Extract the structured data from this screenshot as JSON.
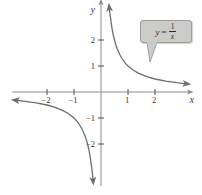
{
  "figure": {
    "background": "#ffffff",
    "axis_color": "#8d8d8d",
    "curve_color": "#6e6e6e",
    "tick_color": "#4d4d4d",
    "label_color": "#333333",
    "callout": {
      "fill": "#cbcbca",
      "border": "#9d9d9c",
      "lhs": "y",
      "equals": "=",
      "numerator": "1",
      "denominator": "x"
    }
  },
  "chart_data": {
    "type": "line",
    "title": "",
    "expression": "y = 1/x",
    "xlabel": "x",
    "ylabel": "y",
    "xlim": [
      -3.3,
      3.4
    ],
    "ylim": [
      -3.6,
      3.4
    ],
    "grid": false,
    "legend": "none",
    "x_ticks": [
      -2,
      -1,
      1,
      2
    ],
    "x_tick_labels": [
      "−2",
      "−1",
      "1",
      "2"
    ],
    "y_ticks": [
      -2,
      -1,
      1,
      2
    ],
    "y_tick_labels": [
      "−2",
      "−1",
      "1",
      "2"
    ],
    "series": [
      {
        "name": "positive-branch",
        "points": [
          [
            0.3,
            3.333
          ],
          [
            0.32,
            3.125
          ],
          [
            0.35,
            2.857
          ],
          [
            0.38,
            2.632
          ],
          [
            0.42,
            2.381
          ],
          [
            0.46,
            2.174
          ],
          [
            0.5,
            2.0
          ],
          [
            0.55,
            1.818
          ],
          [
            0.6,
            1.667
          ],
          [
            0.7,
            1.429
          ],
          [
            0.8,
            1.25
          ],
          [
            0.9,
            1.111
          ],
          [
            1.0,
            1.0
          ],
          [
            1.2,
            0.833
          ],
          [
            1.4,
            0.714
          ],
          [
            1.7,
            0.588
          ],
          [
            2.0,
            0.5
          ],
          [
            2.4,
            0.417
          ],
          [
            2.8,
            0.357
          ],
          [
            3.1,
            0.323
          ],
          [
            3.25,
            0.308
          ]
        ]
      },
      {
        "name": "negative-branch",
        "points": [
          [
            -3.25,
            -0.308
          ],
          [
            -3.1,
            -0.323
          ],
          [
            -2.8,
            -0.357
          ],
          [
            -2.4,
            -0.417
          ],
          [
            -2.0,
            -0.5
          ],
          [
            -1.7,
            -0.588
          ],
          [
            -1.4,
            -0.714
          ],
          [
            -1.2,
            -0.833
          ],
          [
            -1.0,
            -1.0
          ],
          [
            -0.9,
            -1.111
          ],
          [
            -0.8,
            -1.25
          ],
          [
            -0.7,
            -1.429
          ],
          [
            -0.6,
            -1.667
          ],
          [
            -0.55,
            -1.818
          ],
          [
            -0.5,
            -2.0
          ],
          [
            -0.46,
            -2.174
          ],
          [
            -0.42,
            -2.381
          ],
          [
            -0.38,
            -2.632
          ],
          [
            -0.35,
            -2.857
          ],
          [
            -0.32,
            -3.125
          ],
          [
            -0.285,
            -3.509
          ]
        ]
      }
    ],
    "annotations": [
      {
        "text": "y = 1/x",
        "style": "callout-box",
        "target": "positive-branch"
      }
    ]
  }
}
